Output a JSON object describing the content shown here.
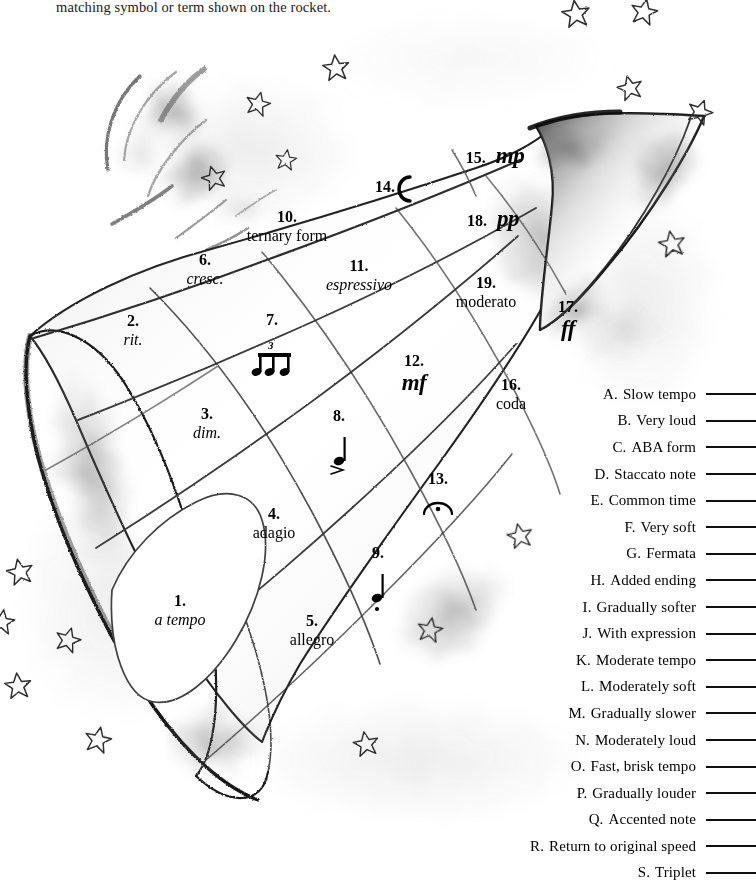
{
  "instructions": {
    "text": "matching symbol or term shown on the rocket."
  },
  "rocket": {
    "title": "music-terms-rocket-diagram",
    "labels": [
      {
        "num": "1.",
        "term": "a tempo",
        "style": "italic"
      },
      {
        "num": "2.",
        "term": "rit.",
        "style": "italic"
      },
      {
        "num": "3.",
        "term": "dim.",
        "style": "italic"
      },
      {
        "num": "4.",
        "term": "adagio",
        "style": "roman"
      },
      {
        "num": "5.",
        "term": "allegro",
        "style": "roman"
      },
      {
        "num": "6.",
        "term": "cresc.",
        "style": "italic"
      },
      {
        "num": "7.",
        "term": "triplet-eighth-notes",
        "style": "glyph"
      },
      {
        "num": "8.",
        "term": "accented-quarter-note",
        "style": "glyph"
      },
      {
        "num": "9.",
        "term": "staccato-quarter-note",
        "style": "glyph"
      },
      {
        "num": "10.",
        "term": "ternary form",
        "style": "roman"
      },
      {
        "num": "11.",
        "term": "espressivo",
        "style": "italic"
      },
      {
        "num": "12.",
        "term": "mf",
        "style": "dynamic"
      },
      {
        "num": "13.",
        "term": "fermata",
        "style": "glyph"
      },
      {
        "num": "14.",
        "term": "C",
        "style": "common-time"
      },
      {
        "num": "15.",
        "term": "mp",
        "style": "dynamic"
      },
      {
        "num": "16.",
        "term": "coda",
        "style": "roman"
      },
      {
        "num": "17.",
        "term": "ff",
        "style": "dynamic"
      },
      {
        "num": "18.",
        "term": "pp",
        "style": "dynamic"
      },
      {
        "num": "19.",
        "term": "moderato",
        "style": "roman"
      }
    ]
  },
  "answer_key": {
    "items": [
      {
        "letter": "A.",
        "text": "Slow tempo"
      },
      {
        "letter": "B.",
        "text": "Very loud"
      },
      {
        "letter": "C.",
        "text": "ABA form"
      },
      {
        "letter": "D.",
        "text": "Staccato note"
      },
      {
        "letter": "E.",
        "text": "Common time"
      },
      {
        "letter": "F.",
        "text": "Very soft"
      },
      {
        "letter": "G.",
        "text": "Fermata"
      },
      {
        "letter": "H.",
        "text": "Added ending"
      },
      {
        "letter": "I.",
        "text": "Gradually softer"
      },
      {
        "letter": "J.",
        "text": "With expression"
      },
      {
        "letter": "K.",
        "text": "Moderate tempo"
      },
      {
        "letter": "L.",
        "text": "Moderately soft"
      },
      {
        "letter": "M.",
        "text": "Gradually slower"
      },
      {
        "letter": "N.",
        "text": "Moderately loud"
      },
      {
        "letter": "O.",
        "text": "Fast, brisk tempo"
      },
      {
        "letter": "P.",
        "text": "Gradually louder"
      },
      {
        "letter": "Q.",
        "text": "Accented note"
      },
      {
        "letter": "R.",
        "text": "Return to original speed"
      },
      {
        "letter": "S.",
        "text": "Triplet"
      }
    ]
  }
}
